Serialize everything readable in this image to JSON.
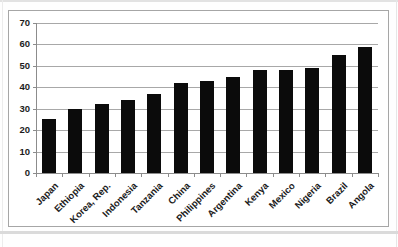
{
  "chart_data": {
    "type": "bar",
    "title": "",
    "subtitle": "",
    "categories": [
      "Japan",
      "Ethiopia",
      "Korea, Rep.",
      "Indonesia",
      "Tanzania",
      "China",
      "Philippines",
      "Argentina",
      "Kenya",
      "Mexico",
      "Nigeria",
      "Brazil",
      "Angola"
    ],
    "values": [
      25,
      30,
      32,
      34,
      37,
      42,
      43,
      45,
      48,
      48,
      49,
      55,
      59
    ],
    "xlabel": "",
    "ylabel": "",
    "ylim": [
      0,
      70
    ],
    "yticks": [
      0,
      10,
      20,
      30,
      40,
      50,
      60,
      70
    ],
    "grid": true,
    "legend": false,
    "x_label_rotation_deg": -45,
    "bar_color": "#0b0b0b",
    "gridline_color": "#a8a8a8",
    "axis_color": "#8c8c8c",
    "chart_border_color": "#a6a6a6",
    "tick_label_color": "#1c1c1c",
    "plot_background": "#ffffff"
  }
}
